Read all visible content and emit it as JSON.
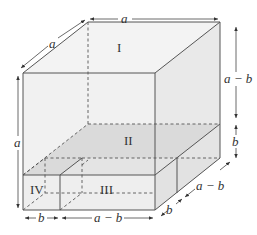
{
  "figure": {
    "colors": {
      "face_light": "#f2f2f2",
      "face_shaded": "#dcdcdc",
      "edge": "#555555",
      "background": "#ffffff"
    },
    "regions": {
      "I": "I",
      "II": "II",
      "III": "III",
      "IV": "IV"
    },
    "dimensions": {
      "top_width": "a",
      "top_depth": "a",
      "left_height": "a",
      "right_upper_height": "a − b",
      "right_lower_height": "b",
      "bottom_left_width": "b",
      "bottom_right_width": "a − b",
      "depth_front": "b",
      "depth_back": "a − b"
    }
  }
}
